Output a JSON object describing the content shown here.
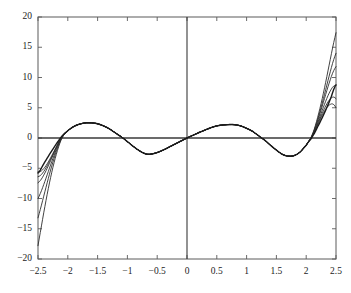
{
  "chart_data": {
    "type": "line",
    "title": "",
    "subtitle": "",
    "xlabel": "",
    "ylabel": "",
    "xlim": [
      -2.5,
      2.5
    ],
    "ylim": [
      -20,
      20
    ],
    "xticks": [
      -2.5,
      -2,
      -1.5,
      -1,
      -0.5,
      0,
      0.5,
      1,
      1.5,
      2,
      2.5
    ],
    "xtick_labels": [
      "−2.5",
      "−2",
      "−1.5",
      "−1",
      "−0.5",
      "0",
      "0.5",
      "1",
      "1.5",
      "2",
      "2.5"
    ],
    "yticks": [
      -20,
      -15,
      -10,
      -5,
      0,
      5,
      10,
      15,
      20
    ],
    "ytick_labels": [
      "−20",
      "−15",
      "−10",
      "−5",
      "0",
      "5",
      "10",
      "15",
      "20"
    ],
    "grid": false,
    "legend": null,
    "axis_lines": {
      "x_axis_at_y": 0,
      "y_axis_at_x": 0,
      "color": "#3a3a3a"
    },
    "box_border": true,
    "series": [
      {
        "name": "target",
        "color": "#1a1a1a",
        "width": 1.4,
        "description": "oscillating reference curve, maxima approx 2.5 at x=-1.65 and 2.2 at x=0.7, minima approx -2.7 at x=-0.65 and -3.0 at x=1.7, zeros near -2.2, -1.15, 0, 1.25, 2.1",
        "points": [
          [
            -2.5,
            -5.8
          ],
          [
            -2.4,
            -4.2
          ],
          [
            -2.3,
            -2.6
          ],
          [
            -2.2,
            -1.1
          ],
          [
            -2.1,
            0.3
          ],
          [
            -2.0,
            1.2
          ],
          [
            -1.9,
            1.9
          ],
          [
            -1.8,
            2.3
          ],
          [
            -1.7,
            2.5
          ],
          [
            -1.65,
            2.52
          ],
          [
            -1.6,
            2.5
          ],
          [
            -1.5,
            2.35
          ],
          [
            -1.4,
            2.0
          ],
          [
            -1.3,
            1.5
          ],
          [
            -1.2,
            0.85
          ],
          [
            -1.15,
            0.5
          ],
          [
            -1.1,
            0.15
          ],
          [
            -1.0,
            -0.6
          ],
          [
            -0.9,
            -1.4
          ],
          [
            -0.8,
            -2.1
          ],
          [
            -0.7,
            -2.6
          ],
          [
            -0.65,
            -2.7
          ],
          [
            -0.6,
            -2.65
          ],
          [
            -0.5,
            -2.4
          ],
          [
            -0.4,
            -2.0
          ],
          [
            -0.3,
            -1.5
          ],
          [
            -0.2,
            -1.0
          ],
          [
            -0.1,
            -0.5
          ],
          [
            0.0,
            0.0
          ],
          [
            0.1,
            0.45
          ],
          [
            0.2,
            0.9
          ],
          [
            0.3,
            1.3
          ],
          [
            0.4,
            1.7
          ],
          [
            0.5,
            2.0
          ],
          [
            0.6,
            2.15
          ],
          [
            0.7,
            2.22
          ],
          [
            0.8,
            2.2
          ],
          [
            0.9,
            2.0
          ],
          [
            1.0,
            1.6
          ],
          [
            1.1,
            1.1
          ],
          [
            1.2,
            0.4
          ],
          [
            1.25,
            0.0
          ],
          [
            1.3,
            -0.35
          ],
          [
            1.4,
            -1.2
          ],
          [
            1.5,
            -2.0
          ],
          [
            1.6,
            -2.7
          ],
          [
            1.7,
            -3.0
          ],
          [
            1.8,
            -2.9
          ],
          [
            1.9,
            -2.3
          ],
          [
            2.0,
            -1.2
          ],
          [
            2.05,
            -0.5
          ],
          [
            2.1,
            0.2
          ],
          [
            2.2,
            2.0
          ],
          [
            2.3,
            4.0
          ],
          [
            2.4,
            6.3
          ],
          [
            2.5,
            8.8
          ]
        ]
      },
      {
        "name": "approximation-1",
        "color": "#2d2d2d",
        "width": 0.9,
        "divergence": {
          "left_end_y": -17.8,
          "right_end_y": 17.4
        },
        "branch_start_left_x": -2.0,
        "branch_start_right_x": 2.0
      },
      {
        "name": "approximation-2",
        "color": "#2d2d2d",
        "width": 0.9,
        "divergence": {
          "left_end_y": -13.2,
          "right_end_y": 14.0
        },
        "branch_start_left_x": -2.0,
        "branch_start_right_x": 2.0
      },
      {
        "name": "approximation-3",
        "color": "#2d2d2d",
        "width": 0.9,
        "divergence": {
          "left_end_y": -10.0,
          "right_end_y": 11.8
        },
        "branch_start_left_x": -2.0,
        "branch_start_right_x": 2.0
      },
      {
        "name": "approximation-4",
        "color": "#2d2d2d",
        "width": 0.9,
        "divergence": {
          "left_end_y": -7.4,
          "right_end_y": 8.7
        },
        "branch_start_left_x": -2.0,
        "branch_start_right_x": 2.0
      },
      {
        "name": "approximation-5",
        "color": "#2d2d2d",
        "width": 0.9,
        "divergence": {
          "left_end_y": -6.4,
          "right_end_y": 6.5
        },
        "branch_start_left_x": -2.0,
        "branch_start_right_x": 2.0
      },
      {
        "name": "approximation-6",
        "color": "#2d2d2d",
        "width": 0.9,
        "divergence": {
          "left_end_y": -5.6,
          "right_end_y": 5.0
        },
        "branch_start_left_x": -2.0,
        "branch_start_right_x": 2.0
      }
    ]
  },
  "geometry": {
    "plot_left": 38,
    "plot_right": 336,
    "plot_top": 17,
    "plot_bottom": 259
  }
}
